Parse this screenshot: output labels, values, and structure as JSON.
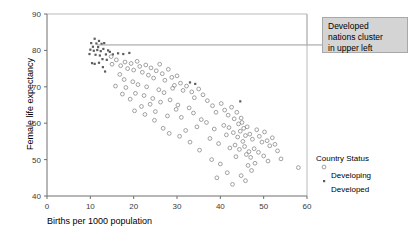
{
  "chart_data": {
    "type": "scatter",
    "title": "",
    "xlabel": "Births per 1000 population",
    "ylabel": "Female life expectancy",
    "xlim": [
      0,
      60
    ],
    "ylim": [
      40,
      90
    ],
    "xticks": [
      0,
      10,
      20,
      30,
      40,
      50,
      60
    ],
    "yticks": [
      40,
      50,
      60,
      70,
      80,
      90
    ],
    "grid": false,
    "legend": {
      "title": "Country Status",
      "position": "right",
      "entries": [
        {
          "label": "Developing",
          "marker": "open-circle",
          "color": "#8a8a8a"
        },
        {
          "label": "Developed",
          "marker": "filled-dot",
          "color": "#5d5d5d"
        }
      ]
    },
    "annotations": [
      {
        "text": "Developed nations cluster in upper left",
        "lines": [
          "Developed",
          "nations cluster",
          "in upper left"
        ],
        "box_fill": "#d4d4d4",
        "box_stroke": "#a8a8a8",
        "leader": {
          "from_x": 11.5,
          "from_y": 81.5,
          "to_x": 60,
          "to_y": 81.5
        }
      }
    ],
    "series": [
      {
        "name": "Developed",
        "marker": "filled-dot",
        "color": "#5d5d5d",
        "points": [
          [
            10.2,
            82.0
          ],
          [
            11.0,
            83.2
          ],
          [
            11.4,
            81.9
          ],
          [
            12.0,
            82.6
          ],
          [
            10.6,
            81.0
          ],
          [
            11.8,
            80.9
          ],
          [
            12.6,
            81.8
          ],
          [
            13.2,
            82.0
          ],
          [
            10.0,
            80.2
          ],
          [
            10.8,
            79.9
          ],
          [
            11.6,
            80.1
          ],
          [
            12.4,
            79.8
          ],
          [
            13.0,
            80.4
          ],
          [
            14.1,
            80.0
          ],
          [
            11.2,
            78.8
          ],
          [
            12.2,
            78.6
          ],
          [
            13.6,
            78.9
          ],
          [
            9.8,
            79.0
          ],
          [
            12.8,
            77.6
          ],
          [
            13.8,
            77.4
          ],
          [
            10.4,
            76.5
          ],
          [
            11.0,
            76.3
          ],
          [
            12.0,
            76.6
          ],
          [
            12.9,
            75.4
          ],
          [
            14.5,
            79.6
          ],
          [
            15.2,
            78.9
          ],
          [
            16.4,
            79.2
          ],
          [
            17.6,
            79.0
          ],
          [
            19.0,
            79.3
          ],
          [
            13.4,
            74.2
          ],
          [
            33.0,
            71.2
          ],
          [
            34.2,
            70.8
          ],
          [
            44.6,
            66.0
          ]
        ]
      },
      {
        "name": "Developing",
        "marker": "open-circle",
        "color": "#8a8a8a",
        "points": [
          [
            14.8,
            78.3
          ],
          [
            15.0,
            76.2
          ],
          [
            16.0,
            77.4
          ],
          [
            17.0,
            75.8
          ],
          [
            18.0,
            76.8
          ],
          [
            18.6,
            75.0
          ],
          [
            19.4,
            76.4
          ],
          [
            20.0,
            74.6
          ],
          [
            20.8,
            77.0
          ],
          [
            21.4,
            75.6
          ],
          [
            22.0,
            74.0
          ],
          [
            22.8,
            76.0
          ],
          [
            23.4,
            73.2
          ],
          [
            24.0,
            75.2
          ],
          [
            24.6,
            72.4
          ],
          [
            25.2,
            74.4
          ],
          [
            26.0,
            76.2
          ],
          [
            26.6,
            73.6
          ],
          [
            27.2,
            71.8
          ],
          [
            28.0,
            74.8
          ],
          [
            28.8,
            72.6
          ],
          [
            29.4,
            70.4
          ],
          [
            30.0,
            73.0
          ],
          [
            30.8,
            71.0
          ],
          [
            16.8,
            73.4
          ],
          [
            17.8,
            72.0
          ],
          [
            19.8,
            71.4
          ],
          [
            21.0,
            70.6
          ],
          [
            23.0,
            70.0
          ],
          [
            25.8,
            69.2
          ],
          [
            27.0,
            68.4
          ],
          [
            29.0,
            69.6
          ],
          [
            31.4,
            69.0
          ],
          [
            32.2,
            70.2
          ],
          [
            33.4,
            68.6
          ],
          [
            34.0,
            67.0
          ],
          [
            18.2,
            69.8
          ],
          [
            20.4,
            68.2
          ],
          [
            22.4,
            67.6
          ],
          [
            24.4,
            66.8
          ],
          [
            26.2,
            65.8
          ],
          [
            28.4,
            66.4
          ],
          [
            30.2,
            65.0
          ],
          [
            32.8,
            64.2
          ],
          [
            35.0,
            69.4
          ],
          [
            36.0,
            67.8
          ],
          [
            37.0,
            66.2
          ],
          [
            38.2,
            64.8
          ],
          [
            21.8,
            64.6
          ],
          [
            25.0,
            63.2
          ],
          [
            27.8,
            62.0
          ],
          [
            29.8,
            63.8
          ],
          [
            31.0,
            61.6
          ],
          [
            33.8,
            62.8
          ],
          [
            35.6,
            61.0
          ],
          [
            39.0,
            63.0
          ],
          [
            40.2,
            65.4
          ],
          [
            41.0,
            63.6
          ],
          [
            41.8,
            62.2
          ],
          [
            42.6,
            64.4
          ],
          [
            43.2,
            61.2
          ],
          [
            43.8,
            63.0
          ],
          [
            44.2,
            59.8
          ],
          [
            44.8,
            61.4
          ],
          [
            45.4,
            58.6
          ],
          [
            45.0,
            60.2
          ],
          [
            42.0,
            58.8
          ],
          [
            43.0,
            57.4
          ],
          [
            44.0,
            56.2
          ],
          [
            44.6,
            57.8
          ],
          [
            45.2,
            55.0
          ],
          [
            45.8,
            56.6
          ],
          [
            46.2,
            59.0
          ],
          [
            46.8,
            57.0
          ],
          [
            47.4,
            55.6
          ],
          [
            43.4,
            54.0
          ],
          [
            44.4,
            52.8
          ],
          [
            45.6,
            53.6
          ],
          [
            46.0,
            51.4
          ],
          [
            46.6,
            52.2
          ],
          [
            47.0,
            50.6
          ],
          [
            47.8,
            53.0
          ],
          [
            48.4,
            58.2
          ],
          [
            49.0,
            56.4
          ],
          [
            49.6,
            54.8
          ],
          [
            50.2,
            57.6
          ],
          [
            50.8,
            55.2
          ],
          [
            51.4,
            53.8
          ],
          [
            52.0,
            56.0
          ],
          [
            52.6,
            54.2
          ],
          [
            48.8,
            52.0
          ],
          [
            50.0,
            51.0
          ],
          [
            51.0,
            49.6
          ],
          [
            53.2,
            52.4
          ],
          [
            54.0,
            50.2
          ],
          [
            46.4,
            48.4
          ],
          [
            47.2,
            47.0
          ],
          [
            48.0,
            49.0
          ],
          [
            44.8,
            45.6
          ],
          [
            45.8,
            44.2
          ],
          [
            58.0,
            47.8
          ],
          [
            36.8,
            60.2
          ],
          [
            38.6,
            58.4
          ],
          [
            40.8,
            59.4
          ],
          [
            37.6,
            55.8
          ],
          [
            39.6,
            54.4
          ],
          [
            41.4,
            56.8
          ],
          [
            34.6,
            59.0
          ],
          [
            32.0,
            58.0
          ],
          [
            30.6,
            56.4
          ],
          [
            28.2,
            57.2
          ],
          [
            26.8,
            58.6
          ],
          [
            42.2,
            53.2
          ],
          [
            43.6,
            50.8
          ],
          [
            35.2,
            52.6
          ],
          [
            33.0,
            54.8
          ],
          [
            38.0,
            50.0
          ],
          [
            40.0,
            48.8
          ],
          [
            41.6,
            46.4
          ],
          [
            39.2,
            45.0
          ],
          [
            42.8,
            43.2
          ],
          [
            24.8,
            60.8
          ],
          [
            22.6,
            62.4
          ],
          [
            20.2,
            63.4
          ],
          [
            23.8,
            65.2
          ],
          [
            19.2,
            66.6
          ],
          [
            17.4,
            68.0
          ],
          [
            15.8,
            70.2
          ]
        ]
      }
    ]
  }
}
